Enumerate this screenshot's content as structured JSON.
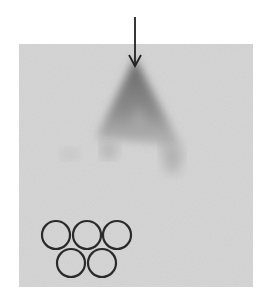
{
  "figure": {
    "background": "#ffffff",
    "panel": {
      "x": 19,
      "y": 44,
      "width": 234,
      "height": 243,
      "color": "#cecece"
    },
    "arrow": {
      "x": 135,
      "y_start": 17,
      "y_end": 66,
      "color": "#222222"
    },
    "smear": {
      "shape": "triangle",
      "apex": [
        135,
        60
      ],
      "base_left": [
        95,
        140
      ],
      "base_right": [
        181,
        146
      ],
      "color": "#6f6f6f"
    },
    "rings": {
      "radius": 14,
      "stroke": "#2a2a2a",
      "stroke_width": 2.2,
      "centers": [
        [
          56,
          235
        ],
        [
          87,
          235
        ],
        [
          117,
          235
        ],
        [
          71,
          263
        ],
        [
          102,
          263
        ]
      ]
    }
  }
}
